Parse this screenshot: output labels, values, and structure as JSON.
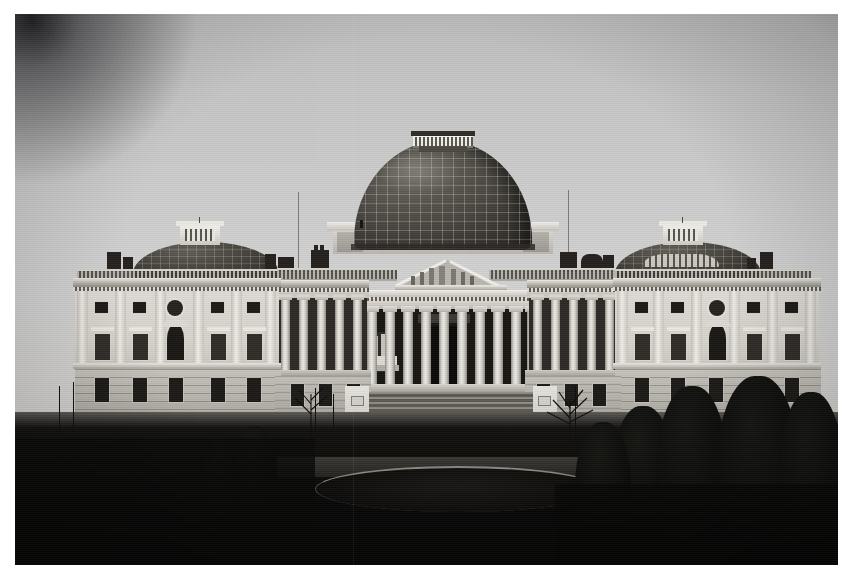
{
  "artifact": {
    "medium": "black-and-white photographic print",
    "kind": "historic architectural photograph",
    "subject": "United States Capitol, east front, with the original low Bulfinch dome",
    "border_color": "#ffffff",
    "print_area": {
      "x": 15,
      "y": 14,
      "width": 823,
      "height": 551
    }
  },
  "scene": {
    "sky": {
      "description": "flat overcast sky, light gray, no clouds",
      "top_tone": "#bcbcbc",
      "horizon_tone": "#d2d2d2"
    },
    "defects": {
      "corner_vignette": "heavy dark blotch in the upper-left corner of the print",
      "scan_lines": "faint horizontal banding across the whole print",
      "foreground": "deep shadow, nearly solid black across the lower third"
    },
    "building": {
      "name": "United States Capitol",
      "facade": "east front",
      "center": {
        "dome": {
          "name": "Bulfinch dome",
          "shape": "low copper-sheathed saucer dome",
          "surface": "gridded ribs and panels",
          "tone": "dark weathered metal",
          "lantern": "small open balustraded lantern at the apex"
        },
        "portico": {
          "order": "Corinthian",
          "column_count": 10,
          "pediment": "triangular pediment with a carved sculptural group",
          "pediment_sculpture": "Genius of America relief figures",
          "entrance": "deep shadowed central doorway",
          "statues": "paired figures on plinths flanking the portico"
        },
        "steps": {
          "description": "broad tiered stone stairway spanning the central block",
          "tiers": 3
        }
      },
      "wings": [
        {
          "side": "north",
          "roof": "low saucer dome with an octagonal glazed cupola",
          "bays": 5,
          "features": "giant pilasters, square attic windows, pedimented first-floor windows, central arched window with an oculus above, rusticated basement"
        },
        {
          "side": "south",
          "roof": "low saucer dome with an octagonal glazed cupola",
          "bays": 5,
          "features": "giant pilasters, square attic windows, pedimented first-floor windows, central arched window with an oculus above, rusticated basement"
        }
      ],
      "connecting_ranges": {
        "description": "recessed colonnaded links joining the wings to the central portico",
        "feature": "screens of freestanding columns above a rusticated basement"
      },
      "roofline": {
        "balustrade": "stone balustrade runs the full length of the roof",
        "chimneys": "rows of chimney stacks with pots behind the balustrade",
        "flagpoles": 2,
        "flagpole_note": "tall bare flagstaffs rise on either side of the dome"
      }
    },
    "grounds": {
      "lawn": "dark grass terrace in front of the building",
      "drive": "curving carriage drive crossing the foreground",
      "circle": "circular basin or planting bed on axis with the steps",
      "trees": {
        "right_foreground": "cluster of tall dark evergreens",
        "left_foreground": "sparse bare-branched saplings",
        "center": "small bare trees flanking the stairway"
      }
    }
  }
}
